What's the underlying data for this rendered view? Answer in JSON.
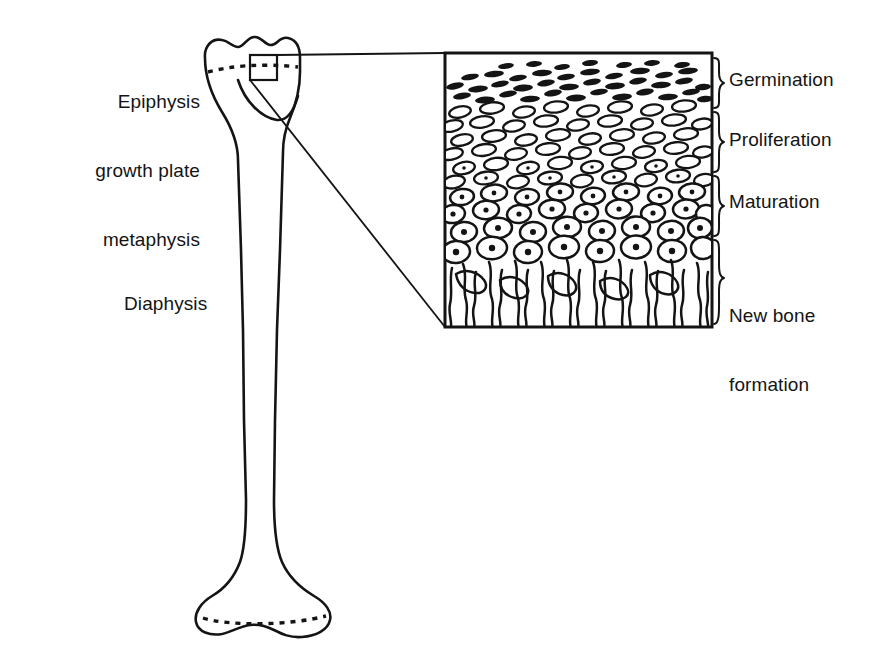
{
  "figure": {
    "colors": {
      "ink": "#141414",
      "background": "#ffffff"
    }
  },
  "bone_labels": {
    "epiphysis_line1": "Epiphysis",
    "epiphysis_line2": "growth plate",
    "epiphysis_line3": "metaphysis",
    "diaphysis": "Diaphysis"
  },
  "zones": [
    {
      "id": "germination",
      "label": "Germination",
      "label_lines": [
        "Germination"
      ],
      "cell_style": "dark-flattened-dashes",
      "brace_top": 58,
      "brace_bottom": 108
    },
    {
      "id": "proliferation",
      "label": "Proliferation",
      "label_lines": [
        "Proliferation"
      ],
      "cell_style": "open-elongated-ovals",
      "brace_top": 112,
      "brace_bottom": 172
    },
    {
      "id": "maturation",
      "label": "Maturation",
      "label_lines": [
        "Maturation"
      ],
      "cell_style": "round-cells-with-nuclei",
      "brace_top": 176,
      "brace_bottom": 236
    },
    {
      "id": "new-bone-formation",
      "label": "New bone formation",
      "label_lines": [
        "New bone",
        "formation"
      ],
      "cell_style": "vertical-trabecular-columns",
      "brace_top": 240,
      "brace_bottom": 324
    }
  ],
  "inset": {
    "x": 445,
    "y": 53,
    "width": 267,
    "height": 274,
    "source_rect": {
      "x": 250,
      "y": 55,
      "width": 27,
      "height": 25
    }
  }
}
